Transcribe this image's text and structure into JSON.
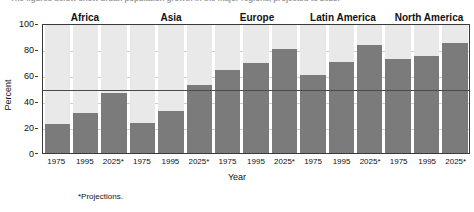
{
  "headline": "The figures below show urban population growth in the major regions, projected to 2025.",
  "footnote": "*Projections.",
  "chart_data": {
    "type": "bar",
    "title": "",
    "xlabel": "Year",
    "ylabel": "Percent",
    "ylim": [
      0,
      100
    ],
    "yticks": [
      0,
      20,
      40,
      60,
      80,
      100
    ],
    "grid": true,
    "legend": "none",
    "reference_line": 50,
    "categories": [
      "1975",
      "1995",
      "2025*"
    ],
    "groups": [
      {
        "name": "Africa",
        "categories": [
          "1975",
          "1995",
          "2025*"
        ],
        "values": [
          22,
          31,
          46
        ]
      },
      {
        "name": "Asia",
        "categories": [
          "1975",
          "1995",
          "2025*"
        ],
        "values": [
          23,
          32,
          52
        ]
      },
      {
        "name": "Europe",
        "categories": [
          "1975",
          "1995",
          "2025*"
        ],
        "values": [
          64,
          69,
          80
        ]
      },
      {
        "name": "Latin America",
        "categories": [
          "1975",
          "1995",
          "2025*"
        ],
        "values": [
          60,
          70,
          83
        ]
      },
      {
        "name": "North America",
        "categories": [
          "1975",
          "1995",
          "2025*"
        ],
        "values": [
          72,
          75,
          85
        ]
      }
    ],
    "colors": {
      "bar": "#7b7b7b",
      "column_background": "#e9e9e9",
      "gridline": "#cfcfcf",
      "reference_line": "#4a4a4a",
      "axis": "#3a3a3a"
    }
  }
}
